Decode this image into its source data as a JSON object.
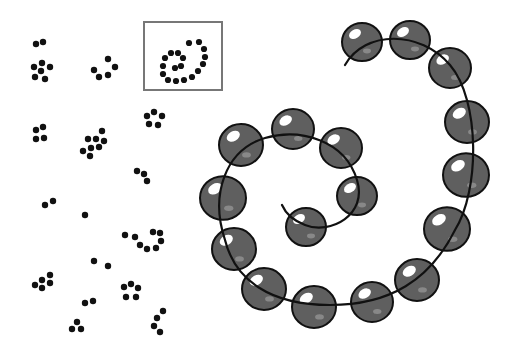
{
  "figure": {
    "width": 518,
    "height": 352,
    "background": "#ffffff",
    "dot_color": "#111111",
    "bead_fill": "#5f5f5f",
    "bead_stroke": "#111111",
    "highlight_color": "#ffffff",
    "box_stroke": "#777777",
    "thread_color": "#111111"
  },
  "clusters": [
    {
      "name": "pair-top-left",
      "dots": [
        [
          36,
          44
        ],
        [
          43,
          42
        ]
      ]
    },
    {
      "name": "cross-five",
      "dots": [
        [
          34,
          67
        ],
        [
          42,
          63
        ],
        [
          50,
          67
        ],
        [
          41,
          71
        ],
        [
          35,
          77
        ],
        [
          45,
          79
        ]
      ]
    },
    {
      "name": "arc-five",
      "dots": [
        [
          94,
          70
        ],
        [
          108,
          59
        ],
        [
          115,
          67
        ],
        [
          99,
          77
        ],
        [
          108,
          75
        ]
      ]
    },
    {
      "name": "square-four",
      "dots": [
        [
          36,
          130
        ],
        [
          43,
          127
        ],
        [
          36,
          139
        ],
        [
          44,
          138
        ]
      ]
    },
    {
      "name": "blob-eight",
      "dots": [
        [
          102,
          131
        ],
        [
          88,
          139
        ],
        [
          96,
          139
        ],
        [
          104,
          141
        ],
        [
          91,
          148
        ],
        [
          99,
          147
        ],
        [
          83,
          151
        ],
        [
          90,
          156
        ]
      ]
    },
    {
      "name": "pentagon-five",
      "dots": [
        [
          147,
          116
        ],
        [
          154,
          112
        ],
        [
          162,
          116
        ],
        [
          149,
          124
        ],
        [
          158,
          125
        ]
      ]
    },
    {
      "name": "chain-three",
      "dots": [
        [
          137,
          171
        ],
        [
          144,
          174
        ],
        [
          147,
          181
        ]
      ]
    },
    {
      "name": "pair-mid-left",
      "dots": [
        [
          45,
          205
        ],
        [
          53,
          201
        ]
      ]
    },
    {
      "name": "single-mid",
      "dots": [
        [
          85,
          215
        ]
      ]
    },
    {
      "name": "hook-seven",
      "dots": [
        [
          125,
          235
        ],
        [
          135,
          237
        ],
        [
          140,
          245
        ],
        [
          147,
          249
        ],
        [
          156,
          248
        ],
        [
          161,
          241
        ],
        [
          153,
          232
        ],
        [
          160,
          233
        ]
      ]
    },
    {
      "name": "pair-lower",
      "dots": [
        [
          94,
          261
        ],
        [
          108,
          266
        ]
      ]
    },
    {
      "name": "cluster-five-low",
      "dots": [
        [
          35,
          285
        ],
        [
          42,
          280
        ],
        [
          50,
          275
        ],
        [
          42,
          288
        ],
        [
          50,
          283
        ]
      ]
    },
    {
      "name": "pentagon-low",
      "dots": [
        [
          124,
          287
        ],
        [
          131,
          284
        ],
        [
          138,
          288
        ],
        [
          126,
          297
        ],
        [
          136,
          297
        ]
      ]
    },
    {
      "name": "pair-bottom",
      "dots": [
        [
          85,
          303
        ],
        [
          93,
          301
        ]
      ]
    },
    {
      "name": "triangle-bottom",
      "dots": [
        [
          77,
          322
        ],
        [
          72,
          329
        ],
        [
          81,
          329
        ]
      ]
    },
    {
      "name": "chain-four",
      "dots": [
        [
          163,
          311
        ],
        [
          157,
          318
        ],
        [
          154,
          326
        ],
        [
          160,
          332
        ]
      ]
    }
  ],
  "inset_box": {
    "x": 144,
    "y": 22,
    "width": 78,
    "height": 68,
    "dots": [
      [
        189,
        43
      ],
      [
        199,
        42
      ],
      [
        204,
        49
      ],
      [
        205,
        57
      ],
      [
        203,
        64
      ],
      [
        198,
        71
      ],
      [
        192,
        77
      ],
      [
        184,
        80
      ],
      [
        176,
        81
      ],
      [
        168,
        80
      ],
      [
        163,
        74
      ],
      [
        163,
        66
      ],
      [
        165,
        58
      ],
      [
        171,
        53
      ],
      [
        178,
        53
      ],
      [
        183,
        58
      ],
      [
        181,
        66
      ],
      [
        175,
        68
      ]
    ]
  },
  "spiral": {
    "thread_path": "M 345 65 C 365 30, 420 30, 450 65 C 480 100, 480 190, 455 230 C 430 280, 390 305, 330 305 C 270 305, 235 280, 225 240 C 210 195, 225 150, 265 138 C 300 128, 345 140, 357 180 C 368 215, 330 235, 305 225 C 292 220, 285 212, 282 205",
    "beads": [
      {
        "cx": 362,
        "cy": 42,
        "r": 20
      },
      {
        "cx": 410,
        "cy": 40,
        "r": 20
      },
      {
        "cx": 450,
        "cy": 68,
        "r": 21
      },
      {
        "cx": 467,
        "cy": 122,
        "r": 22
      },
      {
        "cx": 466,
        "cy": 175,
        "r": 23
      },
      {
        "cx": 447,
        "cy": 229,
        "r": 23
      },
      {
        "cx": 417,
        "cy": 280,
        "r": 22
      },
      {
        "cx": 372,
        "cy": 302,
        "r": 21
      },
      {
        "cx": 314,
        "cy": 307,
        "r": 22
      },
      {
        "cx": 264,
        "cy": 289,
        "r": 22
      },
      {
        "cx": 234,
        "cy": 249,
        "r": 22
      },
      {
        "cx": 223,
        "cy": 198,
        "r": 23
      },
      {
        "cx": 241,
        "cy": 145,
        "r": 22
      },
      {
        "cx": 293,
        "cy": 129,
        "r": 21
      },
      {
        "cx": 341,
        "cy": 148,
        "r": 21
      },
      {
        "cx": 357,
        "cy": 196,
        "r": 20
      },
      {
        "cx": 306,
        "cy": 227,
        "r": 20
      }
    ]
  }
}
